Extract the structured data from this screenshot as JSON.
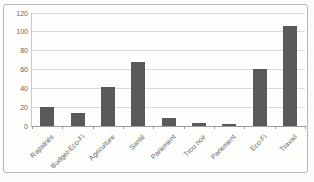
{
  "chart_data": {
    "type": "bar",
    "categories": [
      "Rapatriés",
      "Budget-Eco-Fi",
      "Agriculture",
      "Santé",
      "Parlement",
      "Trou noir",
      "Parlement",
      "Eco-Fi",
      "Travail"
    ],
    "values": [
      20,
      14,
      41,
      68,
      9,
      3,
      2,
      61,
      106
    ],
    "title": "",
    "xlabel": "",
    "ylabel": "",
    "ylim": [
      0,
      120
    ],
    "yticks": [
      0,
      20,
      40,
      60,
      80,
      100,
      120
    ],
    "grid": true,
    "legend": false,
    "bar_color": "#595959",
    "gridline_color": "#d9d9d5",
    "axis_color": "#9b9b97",
    "tick_label_color": "#646460",
    "plot_background": "#fefefd",
    "frame_border_color": "#b7b7b3"
  }
}
